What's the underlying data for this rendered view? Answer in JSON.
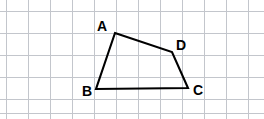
{
  "figure": {
    "kind": "geometry-quadrilateral-on-grid",
    "width": 264,
    "height": 119,
    "background_color": "#ffffff",
    "grid": {
      "visible": true,
      "line_color": "#c3c6cc",
      "line_width": 1,
      "spacing_px": 22,
      "x_origin": 6,
      "y_origin": 11,
      "vertical_x": [
        6,
        28,
        50,
        72,
        94,
        116,
        138,
        160,
        182,
        204,
        226,
        248
      ],
      "horizontal_y": [
        11,
        33,
        55,
        77,
        99,
        113
      ]
    },
    "shape": {
      "name": "ABCD",
      "type": "quadrilateral",
      "closed": true,
      "stroke_color": "#000000",
      "stroke_width": 2.1,
      "fill": "none",
      "points": "115,33 172,52 188,88 96,89",
      "vertices": [
        {
          "id": "A",
          "x": 115,
          "y": 33
        },
        {
          "id": "D",
          "x": 172,
          "y": 52
        },
        {
          "id": "C",
          "x": 188,
          "y": 88
        },
        {
          "id": "B",
          "x": 96,
          "y": 89
        }
      ],
      "edges": [
        {
          "from": "A",
          "to": "D"
        },
        {
          "from": "D",
          "to": "C"
        },
        {
          "from": "C",
          "to": "B"
        },
        {
          "from": "B",
          "to": "A"
        }
      ]
    },
    "labels": [
      {
        "id": "A",
        "text": "A",
        "left": 97,
        "top": 19,
        "font_size": 14,
        "bold": true
      },
      {
        "id": "D",
        "text": "D",
        "left": 176,
        "top": 38,
        "font_size": 14,
        "bold": true
      },
      {
        "id": "B",
        "text": "B",
        "left": 82,
        "top": 84,
        "font_size": 14,
        "bold": true
      },
      {
        "id": "C",
        "text": "C",
        "left": 193,
        "top": 83,
        "font_size": 14,
        "bold": true
      }
    ]
  }
}
